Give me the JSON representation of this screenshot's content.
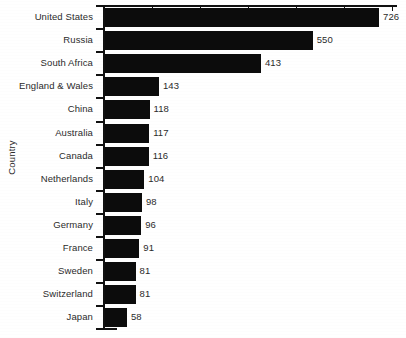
{
  "chart_data": {
    "type": "bar",
    "orientation": "horizontal",
    "title": "",
    "xlabel": "",
    "ylabel": "Country",
    "categories": [
      "United States",
      "Russia",
      "South Africa",
      "England & Wales",
      "China",
      "Australia",
      "Canada",
      "Netherlands",
      "Italy",
      "Germany",
      "France",
      "Sweden",
      "Switzerland",
      "Japan"
    ],
    "values": [
      726,
      550,
      413,
      143,
      118,
      117,
      116,
      104,
      98,
      96,
      91,
      81,
      81,
      58
    ],
    "value_labels": [
      "726",
      "550",
      "413",
      "143",
      "118",
      "117",
      "116",
      "104",
      "98",
      "96",
      "91",
      "81",
      "81",
      "58"
    ],
    "xlim": [
      0,
      780
    ],
    "x_tick_values": [
      0,
      127,
      254,
      381,
      508,
      635,
      762
    ],
    "x_tick_labels": [
      "",
      "",
      "",
      "",
      "",
      "",
      ""
    ],
    "grid": false,
    "legend": null,
    "bar_color": "#0c0c0c",
    "axis_color": "#111111",
    "background_color": "#ffffff"
  },
  "axes": {
    "y_axis_title": "Country"
  }
}
